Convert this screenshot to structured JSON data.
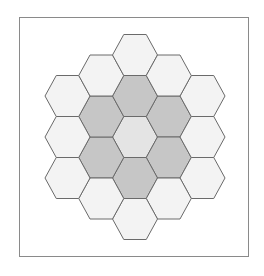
{
  "diagram": {
    "type": "hexagonal-grid",
    "orientation": "flat-top",
    "radius_rings": 2,
    "hex_count": 19,
    "colors": {
      "center": "#e4e4e4",
      "inner_ring": "#c6c6c6",
      "outer_ring": "#f3f3f3",
      "stroke": "#6a6a6a",
      "frame": "#8a8a8a"
    },
    "cells": [
      {
        "q": 0,
        "r": 0,
        "ring": "center"
      },
      {
        "q": 1,
        "r": -1,
        "ring": "inner_ring"
      },
      {
        "q": 1,
        "r": 0,
        "ring": "inner_ring"
      },
      {
        "q": 0,
        "r": 1,
        "ring": "inner_ring"
      },
      {
        "q": -1,
        "r": 1,
        "ring": "inner_ring"
      },
      {
        "q": -1,
        "r": 0,
        "ring": "inner_ring"
      },
      {
        "q": 0,
        "r": -1,
        "ring": "inner_ring"
      },
      {
        "q": 2,
        "r": -2,
        "ring": "outer_ring"
      },
      {
        "q": 2,
        "r": -1,
        "ring": "outer_ring"
      },
      {
        "q": 2,
        "r": 0,
        "ring": "outer_ring"
      },
      {
        "q": 1,
        "r": 1,
        "ring": "outer_ring"
      },
      {
        "q": 0,
        "r": 2,
        "ring": "outer_ring"
      },
      {
        "q": -1,
        "r": 2,
        "ring": "outer_ring"
      },
      {
        "q": -2,
        "r": 2,
        "ring": "outer_ring"
      },
      {
        "q": -2,
        "r": 1,
        "ring": "outer_ring"
      },
      {
        "q": -2,
        "r": 0,
        "ring": "outer_ring"
      },
      {
        "q": -1,
        "r": -1,
        "ring": "outer_ring"
      },
      {
        "q": 0,
        "r": -2,
        "ring": "outer_ring"
      },
      {
        "q": 1,
        "r": -2,
        "ring": "outer_ring"
      }
    ]
  }
}
